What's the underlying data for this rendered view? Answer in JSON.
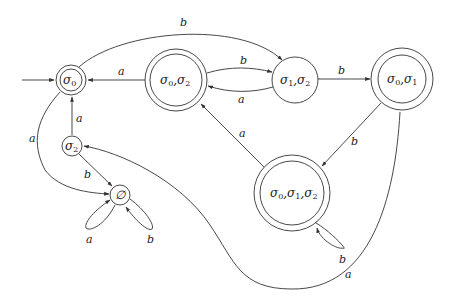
{
  "diagram": {
    "type": "finite-state-automaton",
    "nodes": [
      {
        "id": "s0",
        "label": "σ0",
        "accepting": true,
        "initial": true
      },
      {
        "id": "s02",
        "label": "σ0,σ2",
        "accepting": true,
        "initial": false
      },
      {
        "id": "s12",
        "label": "σ1,σ2",
        "accepting": false,
        "initial": false
      },
      {
        "id": "s01",
        "label": "σ0,σ1",
        "accepting": true,
        "initial": false
      },
      {
        "id": "s012",
        "label": "σ0,σ1,σ2",
        "accepting": true,
        "initial": false
      },
      {
        "id": "s2",
        "label": "σ2",
        "accepting": false,
        "initial": false
      },
      {
        "id": "empty",
        "label": "∅",
        "accepting": false,
        "initial": false
      }
    ],
    "node_text": {
      "s0": {
        "base": "σ",
        "sub": "0"
      },
      "s02": {
        "p1": "σ",
        "s1": "0",
        "p2": ",σ",
        "s2": "2"
      },
      "s12": {
        "p1": "σ",
        "s1": "1",
        "p2": ",σ",
        "s2": "2"
      },
      "s01": {
        "p1": "σ",
        "s1": "0",
        "p2": ",σ",
        "s2": "1"
      },
      "s012": {
        "p1": "σ",
        "s1": "0",
        "p2": ",σ",
        "s2": "1",
        "p3": ",σ",
        "s3": "2"
      },
      "s2": {
        "base": "σ",
        "sub": "2"
      },
      "empty": {
        "base": "∅"
      }
    },
    "edges": [
      {
        "from": "s0",
        "to": "s12",
        "label": "b"
      },
      {
        "from": "s02",
        "to": "s0",
        "label": "a"
      },
      {
        "from": "s02",
        "to": "s12",
        "label": "b"
      },
      {
        "from": "s12",
        "to": "s02",
        "label": "a"
      },
      {
        "from": "s12",
        "to": "s01",
        "label": "b"
      },
      {
        "from": "s01",
        "to": "s012",
        "label": "b"
      },
      {
        "from": "s01",
        "to": "s2",
        "label": "a"
      },
      {
        "from": "s012",
        "to": "s02",
        "label": "a"
      },
      {
        "from": "s012",
        "to": "s012",
        "label": "b"
      },
      {
        "from": "s0",
        "to": "empty",
        "label": "a"
      },
      {
        "from": "s2",
        "to": "s0",
        "label": "a"
      },
      {
        "from": "s2",
        "to": "empty",
        "label": "b"
      },
      {
        "from": "empty",
        "to": "empty",
        "label": "a"
      },
      {
        "from": "empty",
        "to": "empty",
        "label": "b"
      }
    ],
    "edge_labels": {
      "s0_s12": "b",
      "s02_s0": "a",
      "s02_s12": "b",
      "s12_s02": "a",
      "s12_s01": "b",
      "s01_s012": "b",
      "s01_s2": "a",
      "s012_s02": "a",
      "s012_loop": "b",
      "s0_empty": "a",
      "s2_s0": "a",
      "s2_empty": "b",
      "empty_loop_a": "a",
      "empty_loop_b": "b"
    }
  }
}
